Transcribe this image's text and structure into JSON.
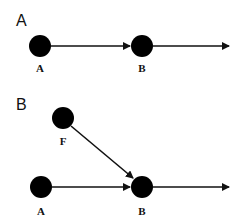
{
  "panels": [
    {
      "label": "A",
      "nodes": [
        {
          "id": "A",
          "label": "A",
          "cx": 40,
          "cy": 46
        },
        {
          "id": "B",
          "label": "B",
          "cx": 142,
          "cy": 46
        }
      ],
      "edges": [
        {
          "from": "A",
          "to": "B"
        },
        {
          "from": "B",
          "to": "out"
        }
      ]
    },
    {
      "label": "B",
      "nodes": [
        {
          "id": "F",
          "label": "F",
          "cx": 63,
          "cy": 118
        },
        {
          "id": "A",
          "label": "A",
          "cx": 41,
          "cy": 187
        },
        {
          "id": "B",
          "label": "B",
          "cx": 142,
          "cy": 187
        }
      ],
      "edges": [
        {
          "from": "F",
          "to": "B"
        },
        {
          "from": "A",
          "to": "B"
        },
        {
          "from": "B",
          "to": "out"
        }
      ]
    }
  ],
  "colors": {
    "node": "#000000",
    "edge": "#111111",
    "background": "#ffffff"
  }
}
